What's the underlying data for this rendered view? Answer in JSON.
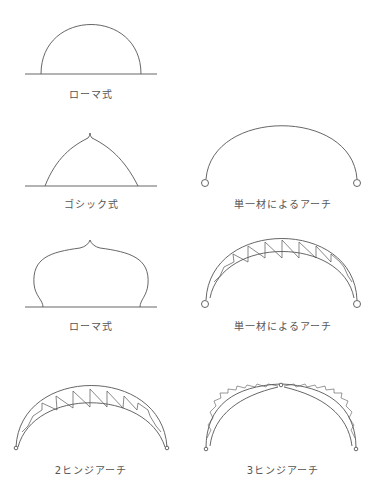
{
  "colors": {
    "line": "#555555",
    "text": "#555555",
    "background": "#ffffff"
  },
  "figures": [
    {
      "id": "roman",
      "label": "ローマ式",
      "shape": "semicircular-arch"
    },
    {
      "id": "gothic",
      "label": "ゴシック式",
      "shape": "pointed-arch"
    },
    {
      "id": "single-member",
      "label": "単一材によるアーチ",
      "shape": "single-member-arch-with-hinges"
    },
    {
      "id": "onion",
      "label": "ローマ式",
      "shape": "onion-dome-arch"
    },
    {
      "id": "truss-single",
      "label": "単一材によるアーチ",
      "shape": "truss-arch-with-hinges"
    },
    {
      "id": "two-hinge",
      "label": "2ヒンジアーチ",
      "shape": "two-hinged-truss-arch"
    },
    {
      "id": "three-hinge",
      "label": "3ヒンジアーチ",
      "shape": "three-hinged-truss-arch"
    }
  ]
}
